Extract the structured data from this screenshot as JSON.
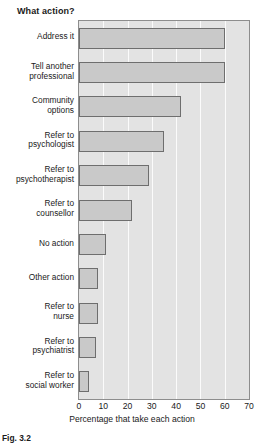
{
  "chart_data": {
    "type": "bar",
    "orientation": "horizontal",
    "title": "What action?",
    "xlabel": "Percentage that take each action",
    "ylabel": "",
    "xlim": [
      0,
      70
    ],
    "xticks": [
      0,
      10,
      20,
      30,
      40,
      50,
      60,
      70
    ],
    "grid": true,
    "grid_axis": "x",
    "legend": null,
    "categories": [
      "Address it",
      "Tell another professional",
      "Community options",
      "Refer to psychologist",
      "Refer to psychotherapist",
      "Refer to counsellor",
      "No action",
      "Other action",
      "Refer to nurse",
      "Refer to psychiatrist",
      "Refer to social worker"
    ],
    "category_lines": [
      [
        "Address it"
      ],
      [
        "Tell another",
        "professional"
      ],
      [
        "Community",
        "options"
      ],
      [
        "Refer to",
        "psychologist"
      ],
      [
        "Refer to",
        "psychotherapist"
      ],
      [
        "Refer to",
        "counsellor"
      ],
      [
        "No action"
      ],
      [
        "Other action"
      ],
      [
        "Refer to",
        "nurse"
      ],
      [
        "Refer to",
        "psychiatrist"
      ],
      [
        "Refer to",
        "social worker"
      ]
    ],
    "values": [
      60,
      60,
      42,
      35,
      29,
      22,
      11,
      8,
      8,
      7,
      4
    ],
    "colors": {
      "bar_fill": "#c9c9c9",
      "bar_edge": "#6e6e6e",
      "plot_background": "#e3e3e3",
      "gridline": "#fbfbfb",
      "frame": "#8d8d8d",
      "text": "#1a1a1a"
    }
  },
  "caption": {
    "label": "Fig. 3.2",
    "text": "Fig. 3.2"
  }
}
